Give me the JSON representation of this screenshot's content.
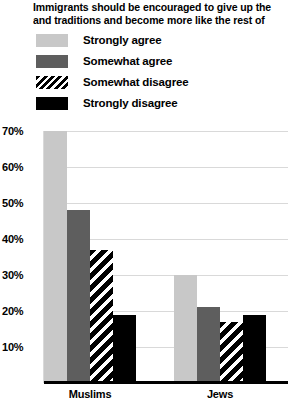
{
  "chart_data": {
    "type": "bar",
    "title_lines": [
      "Immigrants should be encouraged to give up the",
      "and traditions and become more like the rest of"
    ],
    "title": "Immigrants should be encouraged to give up the and traditions and become more like the rest of",
    "xlabel": "",
    "ylabel": "",
    "ylim": [
      0,
      70
    ],
    "ytick_labels": [
      "70%",
      "60%",
      "50%",
      "40%",
      "30%",
      "20%",
      "10%"
    ],
    "ytick_values": [
      70,
      60,
      50,
      40,
      30,
      20,
      10
    ],
    "grid": true,
    "legend_position": "top-left",
    "categories": [
      "Muslims",
      "Jews"
    ],
    "series": [
      {
        "name": "Strongly agree",
        "values": [
          70,
          30
        ],
        "color": "#c8c8c8",
        "pattern": "solid"
      },
      {
        "name": "Somewhat agree",
        "values": [
          48,
          21
        ],
        "color": "#5e5e5e",
        "pattern": "solid"
      },
      {
        "name": "Somewhat disagree",
        "values": [
          37,
          17
        ],
        "color": "#000000",
        "pattern": "diagonal-stripes"
      },
      {
        "name": "Strongly disagree",
        "values": [
          19,
          19
        ],
        "color": "#000000",
        "pattern": "solid"
      }
    ]
  }
}
